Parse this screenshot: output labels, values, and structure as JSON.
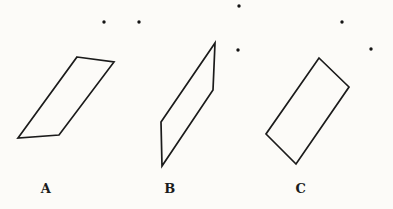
{
  "figure": {
    "background": "#fcfbf8",
    "stroke_color": "#1b1b1b",
    "stroke_width": 1.7,
    "dot_color": "#141414",
    "dot_radius": 1.7,
    "label_color": "#1b1b1b"
  },
  "shapes": [
    {
      "id": "a",
      "label": "A",
      "type": "parallelogram",
      "points": [
        [
          77,
          57
        ],
        [
          114,
          62
        ],
        [
          59,
          135
        ],
        [
          18,
          138
        ]
      ],
      "label_x": 46,
      "label_y": 188
    },
    {
      "id": "b",
      "label": "B",
      "type": "parallelogram",
      "points": [
        [
          215,
          43
        ],
        [
          213,
          90
        ],
        [
          162,
          166
        ],
        [
          161,
          122
        ]
      ],
      "label_x": 170,
      "label_y": 188
    },
    {
      "id": "c",
      "label": "C",
      "type": "rotated-rectangle",
      "points": [
        [
          319,
          58
        ],
        [
          349,
          87
        ],
        [
          296,
          164
        ],
        [
          266,
          134
        ]
      ],
      "label_x": 301,
      "label_y": 188
    }
  ],
  "dots": [
    {
      "x": 104,
      "y": 22
    },
    {
      "x": 139,
      "y": 22
    },
    {
      "x": 239,
      "y": 6
    },
    {
      "x": 342,
      "y": 22
    },
    {
      "x": 238,
      "y": 50
    },
    {
      "x": 371,
      "y": 49
    }
  ]
}
